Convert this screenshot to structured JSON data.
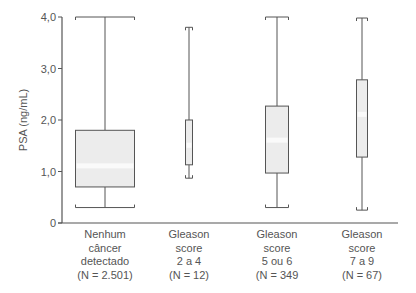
{
  "chart_data": {
    "type": "box",
    "title": "",
    "xlabel": "",
    "ylabel": "PSA (ng/mL)",
    "ylim": [
      0,
      4.0
    ],
    "yticks": [
      "0",
      "1,0",
      "2,0",
      "3,0",
      "4,0"
    ],
    "grid": false,
    "legend": null,
    "categories": [
      [
        "Nenhum",
        "câncer",
        "detectado",
        "(N = 2.501)"
      ],
      [
        "Gleason",
        "score",
        "2 a 4",
        "(N = 12)"
      ],
      [
        "Gleason",
        "score",
        "5 ou 6",
        "(N = 349"
      ],
      [
        "Gleason",
        "score",
        "7 a 9",
        "(N = 67)"
      ]
    ],
    "boxes": [
      {
        "name": "Nenhum câncer detectado",
        "n": 2501,
        "whisker_low": 0.3,
        "q1": 0.7,
        "median": 1.1,
        "q3": 1.8,
        "whisker_high": 4.0
      },
      {
        "name": "Gleason score 2 a 4",
        "n": 12,
        "whisker_low": 0.87,
        "q1": 1.13,
        "median": 1.5,
        "q3": 2.0,
        "whisker_high": 3.8
      },
      {
        "name": "Gleason score 5 ou 6",
        "n": 349,
        "whisker_low": 0.3,
        "q1": 0.97,
        "median": 1.6,
        "q3": 2.27,
        "whisker_high": 4.0
      },
      {
        "name": "Gleason score 7 a 9",
        "n": 67,
        "whisker_low": 0.25,
        "q1": 1.28,
        "median": 2.1,
        "q3": 2.78,
        "whisker_high": 3.98
      }
    ]
  },
  "layout": {
    "box_centers_x": [
      105,
      189,
      277,
      362
    ],
    "box_widths": [
      59,
      7,
      23,
      11
    ],
    "cap_widths": [
      59,
      7,
      23,
      11
    ]
  }
}
